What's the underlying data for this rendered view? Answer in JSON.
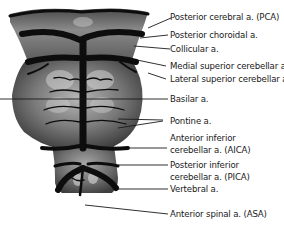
{
  "diagram": {
    "colors": {
      "tissue": "#6e6e6e",
      "tissue_highlight": "#c9c9c9",
      "tissue_shadow": "#3a3a3a",
      "artery": "#0d0d0d",
      "leader_line": "#1a1a1a",
      "text": "#1a1a1a",
      "background": "#ffffff"
    },
    "labels": [
      {
        "id": "pca",
        "line1": "Posterior cerebral a.  (PCA)",
        "line2": ""
      },
      {
        "id": "post-choroidal",
        "line1": "Posterior choroidal a.",
        "line2": ""
      },
      {
        "id": "collicular",
        "line1": "Collicular a.",
        "line2": ""
      },
      {
        "id": "medial-sca",
        "line1": "Medial superior cerebellar a.",
        "line2": ""
      },
      {
        "id": "lateral-sca",
        "line1": "Lateral superior cerebellar a.",
        "line2": ""
      },
      {
        "id": "basilar",
        "line1": "Basilar a.",
        "line2": ""
      },
      {
        "id": "pontine",
        "line1": "Pontine a.",
        "line2": ""
      },
      {
        "id": "aica",
        "line1": "Anterior inferior",
        "line2": "cerebellar a. (AICA)"
      },
      {
        "id": "pica",
        "line1": "Posterior inferior",
        "line2": "cerebellar a. (PICA)"
      },
      {
        "id": "vertebral",
        "line1": "Vertebral a.",
        "line2": ""
      },
      {
        "id": "asa",
        "line1": "Anterior spinal a. (ASA)",
        "line2": ""
      }
    ]
  }
}
